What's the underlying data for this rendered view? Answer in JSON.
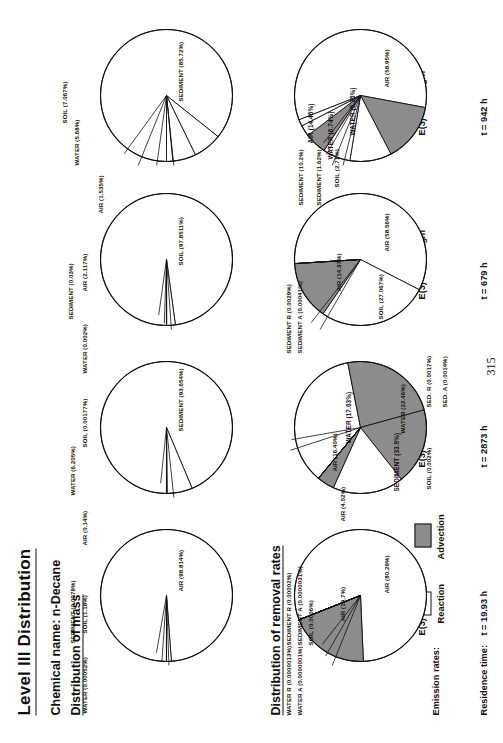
{
  "page": {
    "title": "Level III Distribution",
    "chemical_line": "Chemical name: n-Decane",
    "section_mass": "Distribution of mass",
    "section_removal": "Distribution of removal rates",
    "emission_rates_label": "Emission rates:",
    "residence_time_label": "Residence time:",
    "page_number": "315"
  },
  "legend": {
    "reaction": "Reaction",
    "advection": "Advection",
    "reaction_color": "#ffffff",
    "advection_color": "#8c8c8c",
    "outline_color": "#111111"
  },
  "columns": [
    {
      "id": "col1",
      "emissions": [
        "E(1) = 1000 kg/h",
        "E(2) = 0",
        "E(3) = 0"
      ],
      "residence": "t   =  19.93 h"
    },
    {
      "id": "col2",
      "emissions": [
        "E(1) = 0",
        "E(2) = 1000 kg/h",
        "E(3) = 0"
      ],
      "residence": "t   =  2873 h"
    },
    {
      "id": "col3",
      "emissions": [
        "E(1) = 0",
        "E(2) = 0",
        "E(3) = 1000 kg/h"
      ],
      "residence": "t   =  679 h"
    },
    {
      "id": "col4",
      "emissions": [
        "E(1) = 600 kg/h",
        "E(2) = 300 kg/h",
        "E(3) = 100 kg/h"
      ],
      "residence": "t   =  942 h"
    }
  ],
  "chart_data": [
    {
      "id": "mass-1",
      "type": "pie",
      "title": "Distribution of mass - E(1) = 1000 kg/h",
      "categories": [
        "AIR",
        "SOIL",
        "SEDIMENT",
        "WATER"
      ],
      "values": [
        98.814,
        1.18,
        0.0078,
        0.00052
      ],
      "labels": [
        "AIR (98.814%)",
        "SOIL (1.18%)",
        "SEDIMENT (0.0078%)",
        "WATER (0.00052%)"
      ],
      "colors": [
        "#ffffff",
        "#ffffff",
        "#ffffff",
        "#ffffff"
      ]
    },
    {
      "id": "mass-2",
      "type": "pie",
      "title": "Distribution of mass - E(2) = 1000 kg/h",
      "categories": [
        "SEDIMENT",
        "WATER",
        "AIR",
        "SOIL"
      ],
      "values": [
        93.654,
        6.205,
        0.14,
        0.00177
      ],
      "labels": [
        "SEDIMENT (93.654%)",
        "WATER (6.205%)",
        "AIR (0.14%)",
        "SOIL (0.00177%)"
      ],
      "colors": [
        "#ffffff",
        "#ffffff",
        "#ffffff",
        "#ffffff"
      ]
    },
    {
      "id": "mass-3",
      "type": "pie",
      "title": "Distribution of mass - E(3) = 1000 kg/h",
      "categories": [
        "SOIL",
        "AIR",
        "SEDIMENT",
        "WATER"
      ],
      "values": [
        97.8511,
        2.117,
        0.03,
        0.002
      ],
      "labels": [
        "SOIL (97.8511%)",
        "AIR (2.117%)",
        "SEDIMENT (0.03%)",
        "WATER (0.002%)"
      ],
      "colors": [
        "#ffffff",
        "#ffffff",
        "#ffffff",
        "#ffffff"
      ]
    },
    {
      "id": "mass-4",
      "type": "pie",
      "title": "Distribution of mass - mixed emissions",
      "categories": [
        "SEDIMENT",
        "SOIL",
        "WATER",
        "AIR"
      ],
      "values": [
        85.72,
        7.067,
        5.68,
        1.535
      ],
      "labels": [
        "SEDIMENT (85.72%)",
        "SOIL (7.067%)",
        "WATER (5.68%)",
        "AIR (1.535%)"
      ],
      "colors": [
        "#ffffff",
        "#ffffff",
        "#ffffff",
        "#ffffff"
      ]
    },
    {
      "id": "removal-1",
      "type": "pie",
      "title": "Distribution of removal rates - E(1) = 1000 kg/h",
      "categories": [
        "AIR R",
        "AIR A",
        "SOIL",
        "SEDIMENT R",
        "SEDIMENT A",
        "WATER R",
        "WATER A"
      ],
      "values": [
        80.29,
        19.7,
        0.0006,
        2e-05,
        3.1e-06,
        1.3e-06,
        1e-07
      ],
      "labels": [
        "AIR (80.29%)",
        "AIR (19.7%)",
        "SOIL (0.0006%)",
        "SEDIMENT R (0.00002%)",
        "SEDIMENT A (0.0000031%)",
        "WATER R (0.0000013%)",
        "WATER A (0.0000001%)"
      ],
      "colors": [
        "#ffffff",
        "#8c8c8c",
        "#ffffff",
        "#ffffff",
        "#8c8c8c",
        "#ffffff",
        "#8c8c8c"
      ]
    },
    {
      "id": "removal-2",
      "type": "pie",
      "title": "Distribution of removal rates - E(2) = 1000 kg/h",
      "categories": [
        "SEDIMENT",
        "WATER R",
        "WATER A",
        "AIR R",
        "AIR A",
        "SOIL",
        "SED. R",
        "SED. A"
      ],
      "values": [
        33.9,
        22.46,
        17.63,
        16.4,
        4.02,
        0.002,
        0.0017,
        0.0014
      ],
      "labels": [
        "SEDIMENT (33.9%)",
        "WATER (22.46%)",
        "WATER (17.63%)",
        "AIR (16.40%)",
        "AIR (4.02%)",
        "SOIL (0.002%)",
        "SED. R (0.0017%)",
        "SED. A (0.0014%)"
      ],
      "colors": [
        "#ffffff",
        "#8c8c8c",
        "#8c8c8c",
        "#ffffff",
        "#8c8c8c",
        "#ffffff",
        "#ffffff",
        "#8c8c8c"
      ]
    },
    {
      "id": "removal-3",
      "type": "pie",
      "title": "Distribution of removal rates - E(3) = 1000 kg/h",
      "categories": [
        "AIR R",
        "SOIL",
        "AIR A",
        "SEDIMENT R",
        "SEDIMENT A"
      ],
      "values": [
        58.56,
        27.067,
        14.37,
        0.0029,
        0.00041
      ],
      "labels": [
        "AIR (58.56%)",
        "SOIL (27.067%)",
        "AIR (14.37%)",
        "SEDIMENT R (0.0029%)",
        "SEDIMENT A (0.00041%)"
      ],
      "colors": [
        "#ffffff",
        "#ffffff",
        "#8c8c8c",
        "#ffffff",
        "#8c8c8c"
      ]
    },
    {
      "id": "removal-4",
      "type": "pie",
      "title": "Distribution of removal rates - mixed emissions",
      "categories": [
        "AIR R",
        "AIR A",
        "SEDIMENT",
        "WATER R",
        "WATER A",
        "SOIL",
        "SEDIMENT 2"
      ],
      "values": [
        58.95,
        14.46,
        10.2,
        6.74,
        5.35,
        2.71,
        1.62
      ],
      "labels": [
        "AIR (58.95%)",
        "AIR (14.46%)",
        "SEDIMENT (10.2%)",
        "WATER (6.74%)",
        "WATER (5.35%)",
        "SOIL (2.71%)",
        "SEDIMENT (1.62%)"
      ],
      "colors": [
        "#ffffff",
        "#8c8c8c",
        "#ffffff",
        "#ffffff",
        "#8c8c8c",
        "#ffffff",
        "#ffffff"
      ]
    }
  ]
}
